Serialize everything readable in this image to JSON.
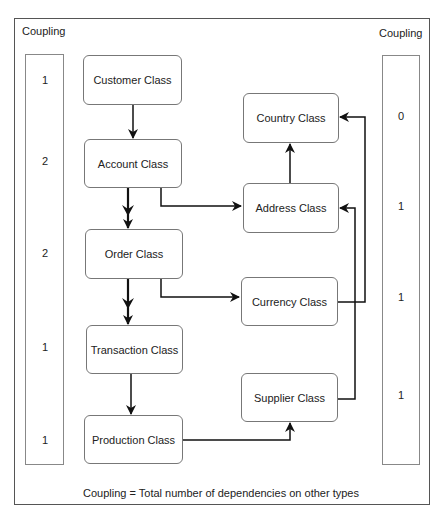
{
  "diagram": {
    "left_column": {
      "title": "Coupling",
      "values": [
        "1",
        "2",
        "2",
        "1",
        "1"
      ]
    },
    "right_column": {
      "title": "Coupling",
      "values": [
        "0",
        "1",
        "1",
        "1"
      ]
    },
    "classes": {
      "customer": "Customer Class",
      "account": "Account Class",
      "order": "Order Class",
      "transaction": "Transaction Class",
      "production": "Production Class",
      "country": "Country Class",
      "address": "Address Class",
      "currency": "Currency Class",
      "supplier": "Supplier Class"
    },
    "edges": [
      {
        "from": "Customer Class",
        "to": "Account Class",
        "style": "single-arrow"
      },
      {
        "from": "Account Class",
        "to": "Order Class",
        "style": "double-arrow"
      },
      {
        "from": "Order Class",
        "to": "Transaction Class",
        "style": "double-arrow"
      },
      {
        "from": "Transaction Class",
        "to": "Production Class",
        "style": "single-arrow"
      },
      {
        "from": "Account Class",
        "to": "Address Class",
        "style": "single-arrow"
      },
      {
        "from": "Order Class",
        "to": "Currency Class",
        "style": "single-arrow"
      },
      {
        "from": "Address Class",
        "to": "Country Class",
        "style": "single-arrow"
      },
      {
        "from": "Currency Class",
        "to": "Country Class",
        "style": "single-arrow"
      },
      {
        "from": "Supplier Class",
        "to": "Address Class",
        "style": "single-arrow"
      },
      {
        "from": "Production Class",
        "to": "Supplier Class",
        "style": "single-arrow"
      }
    ],
    "footer": "Coupling = Total number of dependencies on other types"
  }
}
